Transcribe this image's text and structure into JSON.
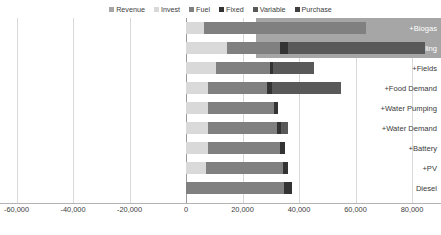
{
  "chart_data": {
    "type": "bar",
    "orientation": "horizontal",
    "stacked": true,
    "title": "",
    "subtitle": "",
    "xlabel": "",
    "ylabel": "",
    "xlim": [
      -60000,
      85000
    ],
    "grid": true,
    "legend_position": "top",
    "xticks": [
      -60000,
      -40000,
      -20000,
      0,
      20000,
      40000,
      60000,
      80000
    ],
    "xtick_labels": [
      "-60,000",
      "-40,000",
      "-20,000",
      "0",
      "20,000",
      "40,000",
      "60,000",
      "80,000"
    ],
    "categories": [
      "+Biogas",
      "+Food Selling",
      "+Fields",
      "+Food Demand",
      "+Water Pumping",
      "+Water Demand",
      "+Battery",
      "+PV",
      "Diesel"
    ],
    "highlighted_categories": [
      "+Biogas",
      "+Food Selling"
    ],
    "series": [
      {
        "name": "Revenue",
        "color": "#a6a6a6",
        "values": [
          0,
          0,
          0,
          0,
          0,
          0,
          0,
          0,
          0
        ]
      },
      {
        "name": "Invest",
        "color": "#d9d9d9",
        "values": [
          6400,
          14500,
          10600,
          7800,
          7800,
          7800,
          7800,
          7100,
          0
        ]
      },
      {
        "name": "Fuel",
        "color": "#808080",
        "values": [
          57300,
          18700,
          19100,
          20900,
          23400,
          24400,
          25500,
          27200,
          34700
        ]
      },
      {
        "name": "Fixed",
        "color": "#333333",
        "values": [
          0,
          2800,
          1100,
          1800,
          1400,
          1400,
          1800,
          1800,
          2800
        ]
      },
      {
        "name": "Variable",
        "color": "#595959",
        "values": [
          0,
          48500,
          14500,
          24400,
          0,
          2500,
          0,
          0,
          0
        ]
      },
      {
        "name": "Purchase",
        "color": "#404040",
        "values": [
          0,
          0,
          0,
          0,
          0,
          0,
          0,
          0,
          0
        ]
      }
    ],
    "totals": [
      63700,
      84500,
      45300,
      54900,
      32600,
      36100,
      35100,
      36100,
      37500
    ]
  },
  "legend": {
    "items": [
      {
        "label": "Revenue",
        "color": "#a6a6a6"
      },
      {
        "label": "Invest",
        "color": "#d9d9d9"
      },
      {
        "label": "Fuel",
        "color": "#808080"
      },
      {
        "label": "Fixed",
        "color": "#333333"
      },
      {
        "label": "Variable",
        "color": "#595959"
      },
      {
        "label": "Purchase",
        "color": "#404040"
      }
    ]
  },
  "axis": {
    "zero_label": "0"
  },
  "colors": {
    "gridline": "#d9d9d9",
    "axis": "#b4b4b4",
    "zeroline": "#9a9a9a",
    "highlight_band": "#a6a6a6",
    "text": "#404040",
    "background": "#ffffff"
  }
}
